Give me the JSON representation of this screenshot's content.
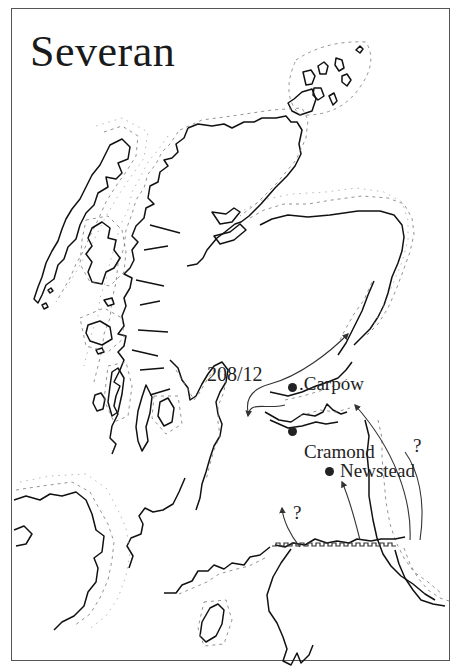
{
  "map": {
    "title": "Severan",
    "campaign_label": "208/12",
    "places": [
      {
        "name": "Carpow",
        "prefix": ".",
        "x": 293,
        "y": 387
      },
      {
        "name": "Cramond",
        "x": 292,
        "y": 431
      },
      {
        "name": "Newstead",
        "x": 329,
        "y": 471
      }
    ],
    "uncertain_markers": [
      {
        "text": "?",
        "x": 352,
        "y": 436
      },
      {
        "text": "?",
        "x": 293,
        "y": 504
      }
    ],
    "features": [
      "Hadrian's Wall (crenellated line)",
      "campaign route arrows",
      "coastlines with offshore dashed contours"
    ],
    "colors": {
      "ink": "#222222",
      "frame": "#555555",
      "background": "#ffffff"
    }
  }
}
